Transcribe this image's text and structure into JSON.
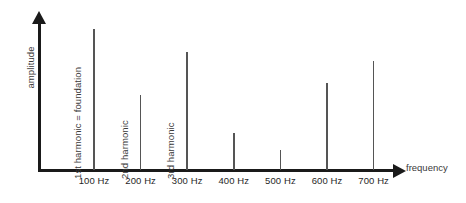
{
  "figure": {
    "background_color": "#ffffff",
    "axis_color": "#1a1a1a",
    "spike_color": "#555555",
    "text_color": "#3a3a3a"
  },
  "chart_data": {
    "type": "bar",
    "title": "",
    "subtitle": "",
    "xlabel": "frequency",
    "ylabel": "amplitude",
    "grid": false,
    "legend": "none",
    "xlim": [
      0,
      800
    ],
    "ylim": [
      0,
      100
    ],
    "categories": [
      "100 Hz",
      "200 Hz",
      "300 Hz",
      "400 Hz",
      "500 Hz",
      "600 Hz",
      "700 Hz"
    ],
    "x": [
      100,
      200,
      300,
      400,
      500,
      600,
      700
    ],
    "values": [
      100,
      53,
      84,
      26,
      14,
      62,
      77
    ],
    "tick_labels": [
      "100 Hz",
      "200 Hz",
      "300 Hz",
      "400 Hz",
      "500 Hz",
      "600 Hz",
      "700 Hz"
    ],
    "annotations": [
      {
        "text": "1st harmonic = foundation",
        "at_category": "100 Hz"
      },
      {
        "text": "2nd harmonic",
        "at_category": "200 Hz"
      },
      {
        "text": "3rd harmonic",
        "at_category": "300 Hz"
      }
    ]
  },
  "axes": {
    "y_title": "amplitude",
    "x_title": "frequency"
  },
  "ticks": [
    {
      "label": "100 Hz"
    },
    {
      "label": "200 Hz"
    },
    {
      "label": "300 Hz"
    },
    {
      "label": "400 Hz"
    },
    {
      "label": "500 Hz"
    },
    {
      "label": "600 Hz"
    },
    {
      "label": "700 Hz"
    }
  ],
  "annotations": [
    {
      "label": "1st harmonic = foundation"
    },
    {
      "label": "2nd harmonic"
    },
    {
      "label": "3rd harmonic"
    }
  ]
}
